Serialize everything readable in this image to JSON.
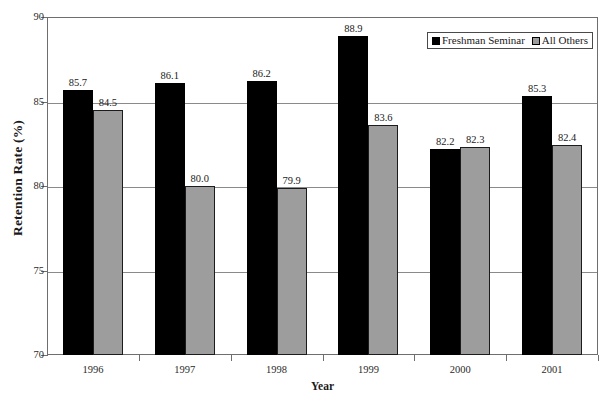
{
  "chart_data": {
    "type": "bar",
    "title": "",
    "xlabel": "Year",
    "ylabel": "Retention Rate (%)",
    "categories": [
      "1996",
      "1997",
      "1998",
      "1999",
      "2000",
      "2001"
    ],
    "series": [
      {
        "name": "Freshman Seminar",
        "color": "#000000",
        "values": [
          85.7,
          86.1,
          86.2,
          88.9,
          82.2,
          85.3
        ]
      },
      {
        "name": "All Others",
        "color": "#9d9d9d",
        "values": [
          84.5,
          80.0,
          79.9,
          83.6,
          82.3,
          82.4
        ]
      }
    ],
    "value_labels": [
      [
        "85.7",
        "86.1",
        "86.2",
        "88.9",
        "82.2",
        "85.3"
      ],
      [
        "84.5",
        "80.0",
        "79.9",
        "83.6",
        "82.3",
        "82.4"
      ]
    ],
    "ylim": [
      70,
      90
    ],
    "yticks": [
      90,
      85,
      80,
      75,
      70
    ],
    "ytick_labels": [
      "90",
      "85",
      "80",
      "75",
      "70"
    ],
    "grid": true,
    "grid_axis": "y",
    "legend_position": "top-right"
  },
  "axis": {
    "y_title": "Retention Rate (%)",
    "x_title": "Year"
  },
  "legend": {
    "entries": [
      {
        "label": "Freshman Seminar",
        "swatch": "black-square-swatch"
      },
      {
        "label": "All Others",
        "swatch": "gray-square-swatch"
      }
    ]
  },
  "cropped_header": " "
}
